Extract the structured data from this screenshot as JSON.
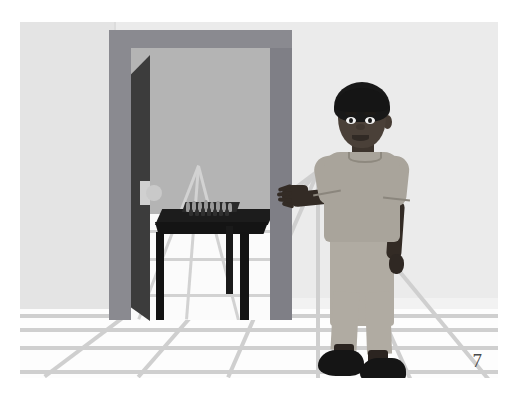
{
  "page": {
    "number": "7",
    "background_color": "#ffffff"
  },
  "illustration": {
    "title": "Boy standing beside an open doorway gesturing toward a room with a chess table",
    "palette": {
      "left_wall": "#e4e4e4",
      "back_wall": "#ebebeb",
      "floor": "#fdfdfd",
      "floor_grid_line": "#cfcfcf",
      "door_frame": "#8a8a90",
      "door_frame_shadow_side": "#7f7f86",
      "door_leaf": "#3c3c3c",
      "door_leaf_edge": "#6e6e6e",
      "door_knob": "#c9c9c9",
      "inner_room_wall": "#b4b4b4",
      "inner_room_floor": "#fbfbfb",
      "table": "#1c1c1c",
      "skin": "#4a4038",
      "hair": "#181818",
      "shirt": "#a9a49b",
      "pants": "#b0aba2",
      "shoes": "#151515"
    },
    "objects": {
      "left_wall": "left wall",
      "back_wall": "back wall",
      "floor": "tiled floor",
      "doorway": "doorway",
      "door_frame": "door frame",
      "door_leaf": "open door",
      "door_knob": "door knob",
      "inner_room": "inner room",
      "table": "dark wooden table",
      "chess_set": "chess board with pieces",
      "boy": "boy",
      "hair": "hair",
      "head": "head",
      "eye_left": "left eye",
      "eye_right": "right eye",
      "nose": "nose",
      "mouth": "mouth",
      "ear": "ear",
      "shirt": "short sleeve t-shirt",
      "pants": "trousers",
      "left_arm": "outstretched left arm",
      "left_hand": "open hand gesturing",
      "right_arm": "right arm at side",
      "right_hand": "right hand",
      "shoe_left": "left shoe",
      "shoe_right": "right shoe"
    }
  },
  "chess_pieces": [
    {
      "x": 4,
      "y": -6,
      "w": 4,
      "h": 10,
      "tone": "light"
    },
    {
      "x": 10,
      "y": -7,
      "w": 4,
      "h": 11,
      "tone": "light"
    },
    {
      "x": 16,
      "y": -6,
      "w": 4,
      "h": 10,
      "tone": "light"
    },
    {
      "x": 22,
      "y": -8,
      "w": 4,
      "h": 12,
      "tone": "light"
    },
    {
      "x": 28,
      "y": -6,
      "w": 4,
      "h": 10,
      "tone": "light"
    },
    {
      "x": 34,
      "y": -7,
      "w": 4,
      "h": 11,
      "tone": "light"
    },
    {
      "x": 40,
      "y": -6,
      "w": 4,
      "h": 10,
      "tone": "light"
    },
    {
      "x": 46,
      "y": -5,
      "w": 4,
      "h": 9,
      "tone": "light"
    },
    {
      "x": 7,
      "y": 1,
      "w": 4,
      "h": 7,
      "tone": "dark"
    },
    {
      "x": 13,
      "y": 1,
      "w": 4,
      "h": 7,
      "tone": "dark"
    },
    {
      "x": 19,
      "y": 0,
      "w": 4,
      "h": 8,
      "tone": "dark"
    },
    {
      "x": 25,
      "y": 0,
      "w": 4,
      "h": 8,
      "tone": "dark"
    },
    {
      "x": 31,
      "y": 1,
      "w": 4,
      "h": 7,
      "tone": "dark"
    },
    {
      "x": 37,
      "y": 1,
      "w": 4,
      "h": 7,
      "tone": "dark"
    },
    {
      "x": 43,
      "y": 1,
      "w": 4,
      "h": 7,
      "tone": "dark"
    }
  ],
  "floor_grid": {
    "horizontal_lines_y": [
      292,
      306,
      324,
      348
    ],
    "vanishing_lines_x": [
      26,
      120,
      210,
      300,
      392,
      470
    ]
  },
  "inner_floor_grid": {
    "horizontal_lines_y": [
      16,
      44,
      80
    ],
    "vanishing_lines_x": [
      10,
      58,
      110
    ]
  }
}
